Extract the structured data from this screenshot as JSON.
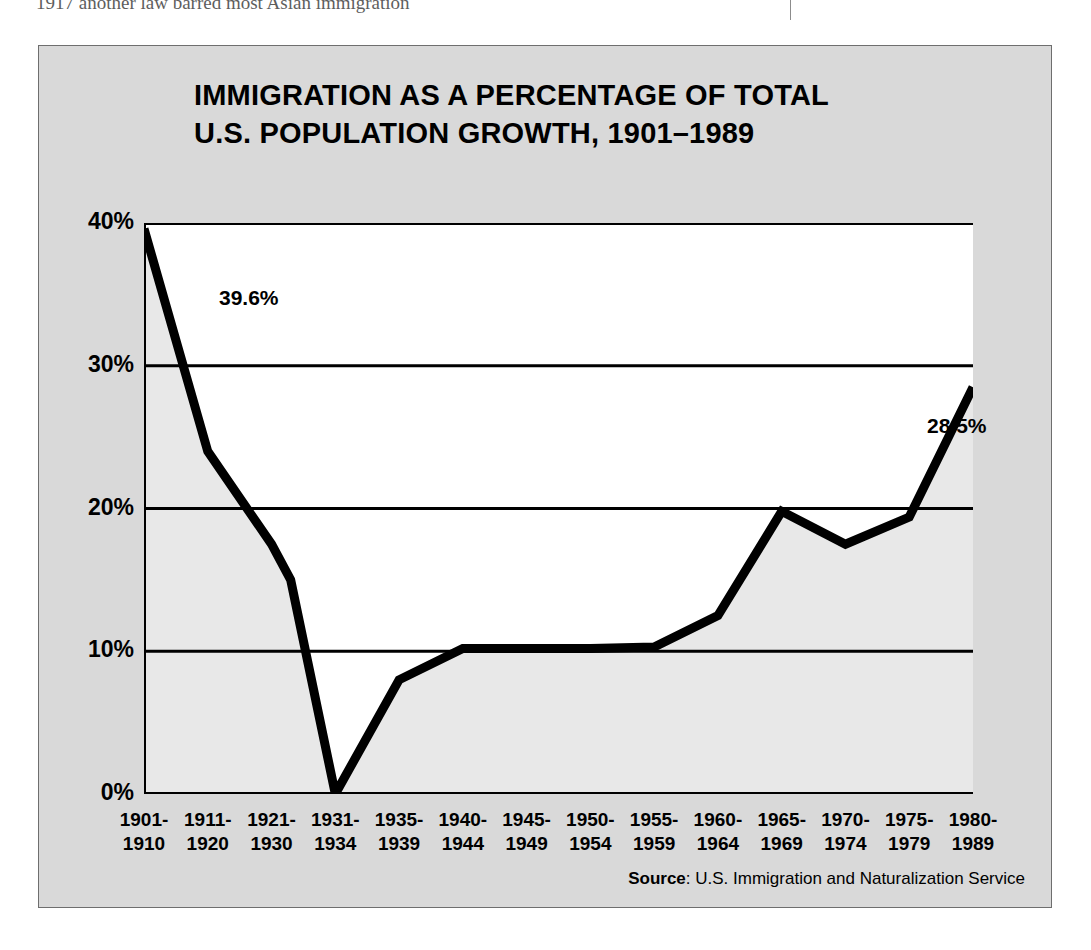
{
  "page": {
    "top_text_fragment": "1917 another law barred most Asian immigration"
  },
  "figure": {
    "title_line1": "IMMIGRATION AS A PERCENTAGE OF TOTAL",
    "title_line2": "U.S. POPULATION GROWTH, 1901–1989",
    "source_label": "Source",
    "source_sep": ": ",
    "source_text": "U.S. Immigration and Naturalization Service",
    "background_color": "#d9d9d9",
    "plot_fill_above": "#ffffff",
    "plot_fill_below": "#e8e8e8",
    "line_color": "#000000"
  },
  "chart_data": {
    "type": "line",
    "title": "IMMIGRATION AS A PERCENTAGE OF TOTAL U.S. POPULATION GROWTH, 1901–1989",
    "xlabel": "",
    "ylabel": "",
    "ylim": [
      0,
      40
    ],
    "yticks": [
      0,
      10,
      20,
      30,
      40
    ],
    "ytick_labels": [
      "0%",
      "10%",
      "20%",
      "30%",
      "40%"
    ],
    "grid": "horizontal",
    "legend": "none",
    "categories": [
      "1901-1910",
      "1911-1920",
      "1921-1930",
      "1931-1934",
      "1935-1939",
      "1940-1944",
      "1945-1949",
      "1950-1954",
      "1955-1959",
      "1960-1964",
      "1965-1969",
      "1970-1974",
      "1975-1979",
      "1980-1989"
    ],
    "category_lines": [
      [
        "1901-",
        "1910"
      ],
      [
        "1911-",
        "1920"
      ],
      [
        "1921-",
        "1930"
      ],
      [
        "1931-",
        "1934"
      ],
      [
        "1935-",
        "1939"
      ],
      [
        "1940-",
        "1944"
      ],
      [
        "1945-",
        "1949"
      ],
      [
        "1950-",
        "1954"
      ],
      [
        "1955-",
        "1959"
      ],
      [
        "1960-",
        "1964"
      ],
      [
        "1965-",
        "1969"
      ],
      [
        "1970-",
        "1974"
      ],
      [
        "1975-",
        "1979"
      ],
      [
        "1980-",
        "1989"
      ]
    ],
    "values": [
      39.6,
      24.0,
      17.5,
      0.0,
      8.0,
      10.2,
      10.2,
      10.2,
      10.3,
      12.5,
      19.8,
      17.5,
      19.4,
      28.5
    ],
    "extra_vertices": [
      {
        "after_category": "1921-1930",
        "x_fraction": 0.3,
        "value": 15.0
      }
    ],
    "annotations": [
      {
        "text": "39.6%",
        "category": "1901-1910",
        "value": 39.6
      },
      {
        "text": "28.5%",
        "category": "1980-1989",
        "value": 28.5
      }
    ]
  }
}
